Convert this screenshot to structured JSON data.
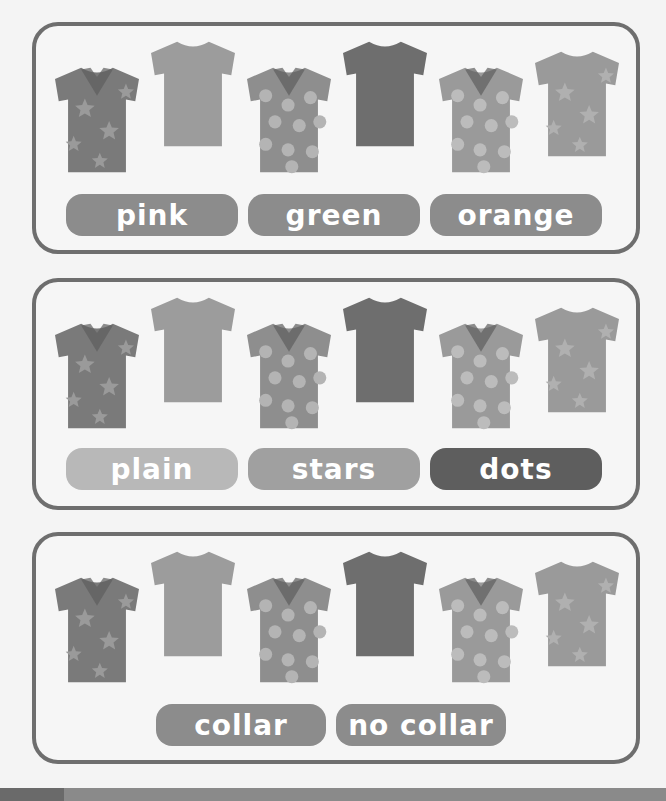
{
  "panels": [
    {
      "name": "color-panel",
      "labels": [
        {
          "text": "pink",
          "color": "#8c8c8c"
        },
        {
          "text": "green",
          "color": "#8c8c8c"
        },
        {
          "text": "orange",
          "color": "#8c8c8c"
        }
      ]
    },
    {
      "name": "pattern-panel",
      "labels": [
        {
          "text": "plain",
          "color": "#b8b8b8"
        },
        {
          "text": "stars",
          "color": "#a0a0a0"
        },
        {
          "text": "dots",
          "color": "#5e5e5e"
        }
      ]
    },
    {
      "name": "collar-panel",
      "labels": [
        {
          "text": "collar",
          "color": "#8c8c8c"
        },
        {
          "text": "no collar",
          "color": "#8c8c8c"
        }
      ]
    }
  ],
  "shirts": [
    {
      "pattern": "stars",
      "collar": true,
      "body": "#7a7a7a",
      "accent": "#9a9a9a"
    },
    {
      "pattern": "plain",
      "collar": false,
      "body": "#9c9c9c",
      "accent": "#9c9c9c"
    },
    {
      "pattern": "dots",
      "collar": true,
      "body": "#8e8e8e",
      "accent": "#b4b4b4"
    },
    {
      "pattern": "plain",
      "collar": false,
      "body": "#6e6e6e",
      "accent": "#6e6e6e"
    },
    {
      "pattern": "dots",
      "collar": true,
      "body": "#9a9a9a",
      "accent": "#bcbcbc"
    },
    {
      "pattern": "stars",
      "collar": false,
      "body": "#9a9a9a",
      "accent": "#b0b0b0"
    }
  ]
}
